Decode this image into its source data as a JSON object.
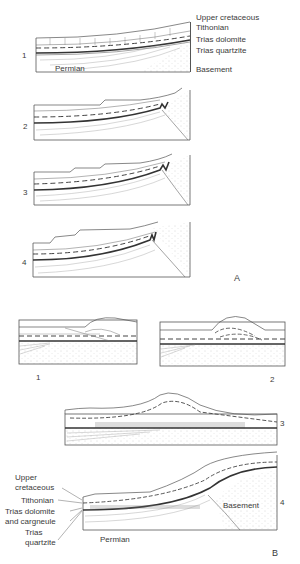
{
  "figure": {
    "part_a": {
      "label": "A",
      "legend": [
        "Upper cretaceous",
        "Tithonian",
        "Trias dolomite",
        "Trias quartzite",
        "Basement"
      ],
      "permian_label": "Permian",
      "stages": [
        "1",
        "2",
        "3",
        "4"
      ]
    },
    "part_b": {
      "label": "B",
      "stages": [
        "1",
        "2",
        "3",
        "4"
      ],
      "legend": {
        "upper_cretaceous_1": "Upper",
        "upper_cretaceous_2": "cretaceous",
        "tithonian": "Tithonian",
        "trias_dolomite_1": "Trias dolomite",
        "trias_dolomite_2": "and cargneule",
        "trias_quartzite_1": "Trias",
        "trias_quartzite_2": "quartzite"
      },
      "permian_label": "Permian",
      "basement_label": "Basement"
    }
  },
  "colors": {
    "line": "#555555",
    "dots": "#9a9a9a",
    "text": "#3a3a3a"
  }
}
